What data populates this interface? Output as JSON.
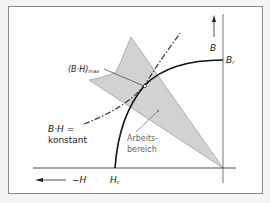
{
  "diagram": {
    "axes": {
      "b_axis_label": "B",
      "h_axis_label": "−H",
      "remanence_label": "B",
      "remanence_sub": "r",
      "coercivity_label": "H",
      "coercivity_sub": "c"
    },
    "annotations": {
      "bh_max": "(B·H)",
      "bh_max_sub": "max",
      "bh_constant_line1": "B·H =",
      "bh_constant_line2": "konstant",
      "working_area_line1": "Arbeits-",
      "working_area_line2": "bereich"
    },
    "colors": {
      "working_area_fill": "#d2d2d2",
      "curve": "#111111",
      "axis": "#555555"
    }
  }
}
